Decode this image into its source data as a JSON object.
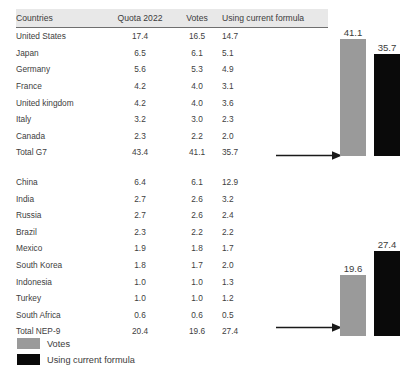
{
  "table": {
    "headers": {
      "country": "Countries",
      "quota": "Quota 2022",
      "votes": "Votes",
      "formula": "Using current formula"
    },
    "g7_rows": [
      {
        "country": "United States",
        "quota": "17.4",
        "votes": "16.5",
        "formula": "14.7"
      },
      {
        "country": "Japan",
        "quota": "6.5",
        "votes": "6.1",
        "formula": "5.1"
      },
      {
        "country": "Germany",
        "quota": "5.6",
        "votes": "5.3",
        "formula": "4.9"
      },
      {
        "country": "France",
        "quota": "4.2",
        "votes": "4.0",
        "formula": "3.1"
      },
      {
        "country": "United kingdom",
        "quota": "4.2",
        "votes": "4.0",
        "formula": "3.6"
      },
      {
        "country": "Italy",
        "quota": "3.2",
        "votes": "3.0",
        "formula": "2.3"
      },
      {
        "country": "Canada",
        "quota": "2.3",
        "votes": "2.2",
        "formula": "2.0"
      },
      {
        "country": "Total G7",
        "quota": "43.4",
        "votes": "41.1",
        "formula": "35.7"
      }
    ],
    "nep9_rows": [
      {
        "country": "China",
        "quota": "6.4",
        "votes": "6.1",
        "formula": "12.9"
      },
      {
        "country": "India",
        "quota": "2.7",
        "votes": "2.6",
        "formula": "3.2"
      },
      {
        "country": "Russia",
        "quota": "2.7",
        "votes": "2.6",
        "formula": "2.4"
      },
      {
        "country": "Brazil",
        "quota": "2.3",
        "votes": "2.2",
        "formula": "2.2"
      },
      {
        "country": "Mexico",
        "quota": "1.9",
        "votes": "1.8",
        "formula": "1.7"
      },
      {
        "country": "South Korea",
        "quota": "1.8",
        "votes": "1.7",
        "formula": "2.0"
      },
      {
        "country": "Indonesia",
        "quota": "1.0",
        "votes": "1.0",
        "formula": "1.3"
      },
      {
        "country": "Turkey",
        "quota": "1.0",
        "votes": "1.0",
        "formula": "1.2"
      },
      {
        "country": "South Africa",
        "quota": "0.6",
        "votes": "0.6",
        "formula": "0.5"
      },
      {
        "country": "Total NEP-9",
        "quota": "20.4",
        "votes": "19.6",
        "formula": "27.4"
      }
    ]
  },
  "legend": {
    "items": [
      {
        "label": "Votes",
        "color": "#9a9a9a"
      },
      {
        "label": "Using current formula",
        "color": "#0a0a0a"
      }
    ]
  },
  "chart_data": [
    {
      "type": "bar",
      "title": "Total G7",
      "categories": [
        "Votes",
        "Using current formula"
      ],
      "values": [
        41.1,
        35.7
      ],
      "labels": [
        "41.1",
        "35.7"
      ],
      "colors": [
        "#9a9a9a",
        "#0a0a0a"
      ],
      "xlabel": "",
      "ylabel": "",
      "ylim": [
        0,
        41.1
      ],
      "grid": false,
      "legend_position": "bottom-left"
    },
    {
      "type": "bar",
      "title": "Total NEP-9",
      "categories": [
        "Votes",
        "Using current formula"
      ],
      "values": [
        19.6,
        27.4
      ],
      "labels": [
        "19.6",
        "27.4"
      ],
      "colors": [
        "#9a9a9a",
        "#0a0a0a"
      ],
      "xlabel": "",
      "ylabel": "",
      "ylim": [
        0,
        27.4
      ],
      "grid": false,
      "legend_position": "bottom-left"
    }
  ]
}
